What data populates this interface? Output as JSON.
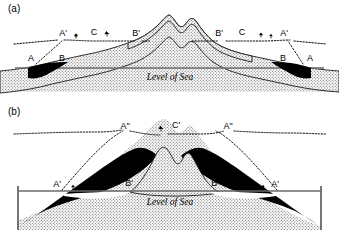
{
  "figure": {
    "sea_level_text": "Level of Sea"
  },
  "panels": [
    {
      "id": "a",
      "label": "(a)",
      "sea_level_text": "Level of Sea",
      "labels": [
        {
          "name": "A-left",
          "text": "A",
          "x": 31,
          "y": 61
        },
        {
          "name": "Aprime-left",
          "text": "A'",
          "x": 63,
          "y": 36
        },
        {
          "name": "B-left",
          "text": "B",
          "x": 62,
          "y": 61
        },
        {
          "name": "C-left",
          "text": "C",
          "x": 94,
          "y": 35
        },
        {
          "name": "Bprime-left",
          "text": "B'",
          "x": 136,
          "y": 36
        },
        {
          "name": "Bprime-right",
          "text": "B'",
          "x": 219,
          "y": 36
        },
        {
          "name": "C-right",
          "text": "C",
          "x": 242,
          "y": 35
        },
        {
          "name": "Aprime-right",
          "text": "A'",
          "x": 284,
          "y": 36
        },
        {
          "name": "B-right",
          "text": "B",
          "x": 283,
          "y": 61
        },
        {
          "name": "A-right",
          "text": "A",
          "x": 310,
          "y": 61
        }
      ],
      "vegetation": [
        {
          "name": "shrub-left-1",
          "x": 76,
          "y": 38
        },
        {
          "name": "shrub-left-2",
          "x": 107,
          "y": 36
        },
        {
          "name": "shrub-right-1",
          "x": 262,
          "y": 36
        },
        {
          "name": "shrub-right-2",
          "x": 272,
          "y": 37
        }
      ]
    },
    {
      "id": "b",
      "label": "(b)",
      "sea_level_text": "Level of Sea",
      "labels": [
        {
          "name": "Aprime-left",
          "text": "A'",
          "x": 57,
          "y": 83
        },
        {
          "name": "C-left",
          "text": "C",
          "x": 95,
          "y": 82
        },
        {
          "name": "Bprime-left",
          "text": "B'",
          "x": 129,
          "y": 82
        },
        {
          "name": "Adprime-left",
          "text": "A\"",
          "x": 125,
          "y": 25
        },
        {
          "name": "Cprime-mid",
          "text": "C'",
          "x": 176,
          "y": 24
        },
        {
          "name": "Adprime-right",
          "text": "A\"",
          "x": 228,
          "y": 25
        },
        {
          "name": "Bprime-right",
          "text": "B'",
          "x": 215,
          "y": 82
        },
        {
          "name": "C-right",
          "text": "C",
          "x": 238,
          "y": 82
        },
        {
          "name": "Aprime-right",
          "text": "A'",
          "x": 275,
          "y": 83
        }
      ],
      "vegetation": [
        {
          "name": "shrub-left-1",
          "x": 73,
          "y": 85
        },
        {
          "name": "shrub-mid-1",
          "x": 162,
          "y": 26
        },
        {
          "name": "shrub-right-1",
          "x": 255,
          "y": 85
        },
        {
          "name": "shrub-right-2",
          "x": 263,
          "y": 85
        }
      ]
    }
  ],
  "colors": {
    "ink": "#000000",
    "sea_line": "#6b6b6b",
    "reef_fill": "#000000",
    "rock_hatch": "#8c8c8c",
    "background": "#ffffff"
  }
}
